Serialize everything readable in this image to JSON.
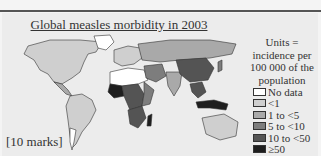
{
  "header": {
    "rule": true
  },
  "map": {
    "title": "Global measles morbidity in 2003",
    "units_note": "Units = incidence per 100 000 of the population",
    "legend": [
      {
        "label": "No data",
        "color": "#ffffff"
      },
      {
        "label": "<1",
        "color": "#cfcfcf"
      },
      {
        "label": "1 to <5",
        "color": "#a9a9a9"
      },
      {
        "label": "5 to <10",
        "color": "#7d7d7d"
      },
      {
        "label": "10 to <50",
        "color": "#545454"
      },
      {
        "label": "≥50",
        "color": "#1e1e1e"
      }
    ]
  },
  "footer": {
    "marks": "[10 marks]"
  }
}
